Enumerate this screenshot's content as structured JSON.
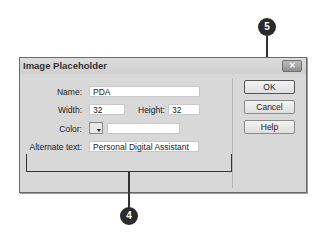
{
  "dialog": {
    "title": "Image Placeholder",
    "close_label": "✕",
    "fields": {
      "name": {
        "label": "Name:",
        "value": "PDA"
      },
      "width": {
        "label": "Width:",
        "value": "32"
      },
      "height": {
        "label": "Height:",
        "value": "32"
      },
      "color": {
        "label": "Color:",
        "value": ""
      },
      "alt": {
        "label": "Alternate text:",
        "value": "Personal Digital Assistant"
      }
    },
    "buttons": {
      "ok": "OK",
      "cancel": "Cancel",
      "help": "Help"
    }
  },
  "callouts": {
    "four": "4",
    "five": "5"
  }
}
